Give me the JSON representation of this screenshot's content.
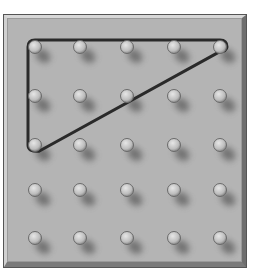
{
  "figure": {
    "type": "geoboard",
    "grid": {
      "columns": 5,
      "rows": 5
    },
    "peg_x": [
      35,
      80,
      127,
      174,
      220
    ],
    "peg_y": [
      47,
      96,
      145,
      190,
      238
    ],
    "colors": {
      "board": "#b4b4b4",
      "peg_fill": "#c8c8c8",
      "peg_edge": "#6a6a6a",
      "peg_shadow": "#5a5a5a",
      "band": "#2a2a2a"
    },
    "band": {
      "shape": "right-triangle",
      "vertices": [
        {
          "col": 0,
          "row": 0
        },
        {
          "col": 4,
          "row": 0
        },
        {
          "col": 0,
          "row": 2
        }
      ]
    }
  }
}
